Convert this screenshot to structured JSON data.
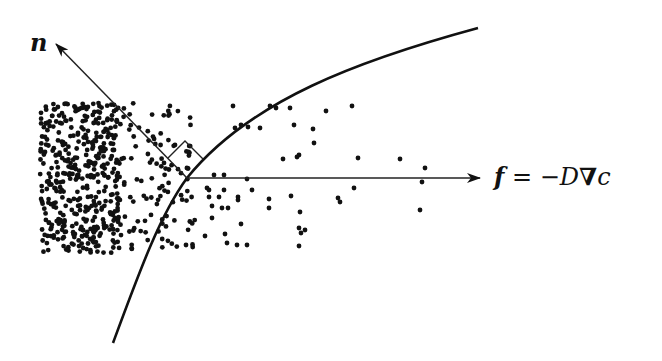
{
  "diagram": {
    "type": "diffusion-flux-across-interface",
    "labels": {
      "normal": "n",
      "flux_symbol": "f",
      "flux_equation": " = −D",
      "nabla": "∇",
      "concentration": "c"
    },
    "colors": {
      "ink": "#111111",
      "background": "#ffffff"
    },
    "elements": [
      {
        "name": "interface-curve",
        "description": "curved boundary rising from lower-left to upper-right"
      },
      {
        "name": "normal-arrow",
        "label": "n",
        "direction": "up-left, perpendicular to interface"
      },
      {
        "name": "flux-arrow",
        "label": "f = −D∇c",
        "direction": "horizontal to the right"
      },
      {
        "name": "right-angle-marker",
        "description": "square showing normal is perpendicular to curve"
      },
      {
        "name": "particle-cloud",
        "description": "dense particles on left, sparse toward right"
      }
    ]
  }
}
